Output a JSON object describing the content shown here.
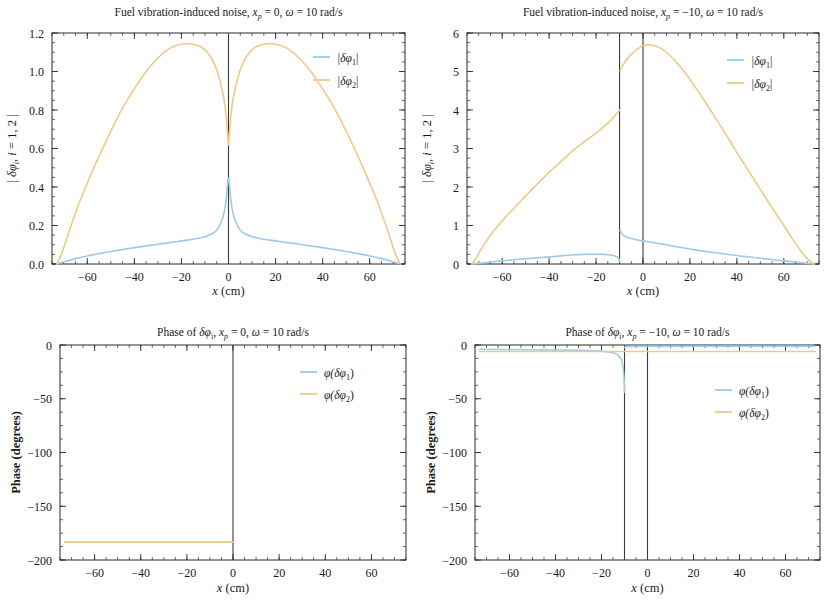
{
  "figure": {
    "background_color": "#ffffff",
    "series_colors": {
      "phi1": "#9fcbe8",
      "phi2": "#f0c98a"
    },
    "axis_color": "#2b2b2b"
  },
  "panels": [
    {
      "id": "top-left",
      "title": "Fuel vibration-induced noise, x_p = 0, ω = 10 rad/s",
      "title_parts": {
        "prefix": "Fuel vibration-induced noise, ",
        "var": "x",
        "sub": "p",
        "mid": " = 0, ",
        "omega": "ω",
        "suffix": " = 10 rad/s"
      },
      "xlabel": "x (cm)",
      "ylabel": "| δφ_i, i = 1, 2 |",
      "xticks": [
        -60,
        -40,
        -20,
        0,
        20,
        40,
        60
      ],
      "yticks": [
        "0.0",
        "0.2",
        "0.4",
        "0.6",
        "0.8",
        "1.0",
        "1.2"
      ],
      "xlim": [
        -75,
        75
      ],
      "ylim": [
        0.0,
        1.2
      ],
      "vertical_marker": 0,
      "legend": [
        {
          "label": "|δφ₁|",
          "base": "|δφ",
          "sub": "1",
          "close": "|",
          "color": "#9fcbe8"
        },
        {
          "label": "|δφ₂|",
          "base": "|δφ",
          "sub": "2",
          "close": "|",
          "color": "#f0c98a"
        }
      ]
    },
    {
      "id": "top-right",
      "title": "Fuel vibration-induced noise, x_p = -10, ω = 10 rad/s",
      "title_parts": {
        "prefix": "Fuel vibration-induced noise, ",
        "var": "x",
        "sub": "p",
        "mid": " = −10, ",
        "omega": "ω",
        "suffix": " = 10 rad/s"
      },
      "xlabel": "x (cm)",
      "ylabel": "| δφ_i, i = 1, 2 |",
      "xticks": [
        -60,
        -40,
        -20,
        0,
        20,
        40,
        60
      ],
      "yticks": [
        "0",
        "1",
        "2",
        "3",
        "4",
        "5",
        "6"
      ],
      "xlim": [
        -75,
        75
      ],
      "ylim": [
        0,
        6
      ],
      "vertical_marker": 0,
      "vertical_marker_2": -10,
      "legend": [
        {
          "label": "|δφ₁|",
          "base": "|δφ",
          "sub": "1",
          "close": "|",
          "color": "#9fcbe8"
        },
        {
          "label": "|δφ₂|",
          "base": "|δφ",
          "sub": "2",
          "close": "|",
          "color": "#f0c98a"
        }
      ]
    },
    {
      "id": "bottom-left",
      "title": "Phase of δφ_i, x_p = 0, ω = 10 rad/s",
      "title_parts": {
        "prefix": "Phase of ",
        "delta": "δφ",
        "isub": "i",
        "comma": ", ",
        "var": "x",
        "sub": "p",
        "mid": " = 0, ",
        "omega": "ω",
        "suffix": " = 10 rad/s"
      },
      "xlabel": "x (cm)",
      "ylabel": "Phase (degrees)",
      "xticks": [
        -60,
        -40,
        -20,
        0,
        20,
        40,
        60
      ],
      "yticks": [
        "0",
        "−50",
        "−100",
        "−150",
        "−200"
      ],
      "xlim": [
        -75,
        75
      ],
      "ylim": [
        -200,
        0
      ],
      "vertical_marker": 0,
      "legend": [
        {
          "label": "φ(δφ₁)",
          "base": "φ(δφ",
          "sub": "1",
          "close": ")",
          "color": "#9fcbe8"
        },
        {
          "label": "φ(δφ₂)",
          "base": "φ(δφ",
          "sub": "2",
          "close": ")",
          "color": "#f0c98a"
        }
      ]
    },
    {
      "id": "bottom-right",
      "title": "Phase of δφ_i, x_p = -10, ω = 10 rad/s",
      "title_parts": {
        "prefix": "Phase of ",
        "delta": "δφ",
        "isub": "i",
        "comma": ", ",
        "var": "x",
        "sub": "p",
        "mid": " = −10, ",
        "omega": "ω",
        "suffix": " = 10 rad/s"
      },
      "xlabel": "x (cm)",
      "ylabel": "Phase (degrees)",
      "xticks": [
        -60,
        -40,
        -20,
        0,
        20,
        40,
        60
      ],
      "yticks": [
        "0",
        "−50",
        "−100",
        "−150",
        "−200"
      ],
      "xlim": [
        -75,
        75
      ],
      "ylim": [
        -200,
        0
      ],
      "vertical_marker": 0,
      "vertical_marker_2": -10,
      "legend": [
        {
          "label": "φ(δφ₁)",
          "base": "φ(δφ",
          "sub": "1",
          "close": ")",
          "color": "#9fcbe8"
        },
        {
          "label": "φ(δφ₂)",
          "base": "φ(δφ",
          "sub": "2",
          "close": ")",
          "color": "#f0c98a"
        }
      ]
    }
  ],
  "chart_data": [
    {
      "type": "line",
      "panel": "top-left",
      "title": "Fuel vibration-induced noise, x_p = 0, ω = 10 rad/s",
      "xlabel": "x (cm)",
      "ylabel": "| δφ_i, i = 1, 2 |",
      "xlim": [
        -75,
        75
      ],
      "ylim": [
        0.0,
        1.2
      ],
      "xticks": [
        -60,
        -40,
        -20,
        0,
        20,
        40,
        60
      ],
      "yticks": [
        0.0,
        0.2,
        0.4,
        0.6,
        0.8,
        1.0,
        1.2
      ],
      "grid": false,
      "legend_position": "top-right",
      "annotations": [
        {
          "type": "vline",
          "x": 0
        }
      ],
      "series": [
        {
          "name": "|δφ₁|",
          "color": "#9fcbe8",
          "x": [
            -73,
            -70,
            -65,
            -60,
            -55,
            -50,
            -45,
            -40,
            -35,
            -30,
            -25,
            -20,
            -15,
            -10,
            -7,
            -5,
            -3,
            -2,
            -1,
            -0.3,
            0,
            0.3,
            1,
            2,
            3,
            5,
            7,
            10,
            15,
            20,
            25,
            30,
            35,
            40,
            45,
            50,
            55,
            60,
            65,
            70,
            73
          ],
          "y": [
            0.0,
            0.012,
            0.028,
            0.042,
            0.054,
            0.065,
            0.075,
            0.085,
            0.094,
            0.103,
            0.111,
            0.12,
            0.129,
            0.142,
            0.157,
            0.175,
            0.22,
            0.26,
            0.33,
            0.43,
            0.445,
            0.43,
            0.33,
            0.26,
            0.22,
            0.175,
            0.157,
            0.142,
            0.129,
            0.12,
            0.111,
            0.103,
            0.094,
            0.085,
            0.075,
            0.065,
            0.054,
            0.042,
            0.028,
            0.012,
            0.0
          ]
        },
        {
          "name": "|δφ₂|",
          "color": "#f0c98a",
          "x": [
            -73,
            -71,
            -68,
            -64,
            -60,
            -55,
            -50,
            -45,
            -40,
            -35,
            -30,
            -25,
            -20,
            -17,
            -15,
            -12,
            -9,
            -6,
            -4,
            -2,
            -1,
            -0.3,
            0,
            0.3,
            1,
            2,
            4,
            6,
            9,
            12,
            15,
            17,
            20,
            25,
            30,
            35,
            40,
            45,
            50,
            55,
            60,
            64,
            68,
            71,
            73
          ],
          "y": [
            0.0,
            0.05,
            0.16,
            0.3,
            0.42,
            0.56,
            0.69,
            0.81,
            0.91,
            1.0,
            1.07,
            1.12,
            1.142,
            1.145,
            1.142,
            1.13,
            1.1,
            1.04,
            0.97,
            0.86,
            0.77,
            0.66,
            0.62,
            0.66,
            0.77,
            0.86,
            0.97,
            1.04,
            1.1,
            1.13,
            1.142,
            1.145,
            1.142,
            1.12,
            1.07,
            1.0,
            0.91,
            0.81,
            0.69,
            0.56,
            0.42,
            0.3,
            0.16,
            0.05,
            0.0
          ]
        }
      ]
    },
    {
      "type": "line",
      "panel": "top-right",
      "title": "Fuel vibration-induced noise, x_p = -10, ω = 10 rad/s",
      "xlabel": "x (cm)",
      "ylabel": "| δφ_i, i = 1, 2 |",
      "xlim": [
        -75,
        75
      ],
      "ylim": [
        0,
        6
      ],
      "xticks": [
        -60,
        -40,
        -20,
        0,
        20,
        40,
        60
      ],
      "yticks": [
        0,
        1,
        2,
        3,
        4,
        5,
        6
      ],
      "grid": false,
      "legend_position": "top-right",
      "annotations": [
        {
          "type": "vline",
          "x": 0
        },
        {
          "type": "vline",
          "x": -10
        }
      ],
      "series": [
        {
          "name": "|δφ₁|",
          "color": "#9fcbe8",
          "x": [
            -73,
            -70,
            -65,
            -60,
            -55,
            -50,
            -45,
            -40,
            -35,
            -30,
            -25,
            -22,
            -20,
            -17,
            -14,
            -12,
            -10.5,
            -10,
            -9.8,
            -9,
            -7,
            -5,
            -2,
            0,
            3,
            6,
            10,
            15,
            20,
            25,
            30,
            35,
            40,
            45,
            50,
            55,
            60,
            65,
            70,
            73
          ],
          "y": [
            0.0,
            0.02,
            0.05,
            0.08,
            0.11,
            0.135,
            0.16,
            0.185,
            0.21,
            0.235,
            0.25,
            0.255,
            0.255,
            0.25,
            0.235,
            0.21,
            0.16,
            0.06,
            0.88,
            0.78,
            0.7,
            0.66,
            0.62,
            0.6,
            0.57,
            0.54,
            0.5,
            0.44,
            0.39,
            0.34,
            0.3,
            0.26,
            0.22,
            0.185,
            0.15,
            0.115,
            0.082,
            0.05,
            0.018,
            0.0
          ]
        },
        {
          "name": "|δφ₂|",
          "color": "#f0c98a",
          "x": [
            -73,
            -71,
            -68,
            -64,
            -60,
            -55,
            -50,
            -45,
            -40,
            -35,
            -30,
            -25,
            -20,
            -16,
            -13,
            -11,
            -10.2,
            -10,
            -9.8,
            -8,
            -6,
            -4,
            -2,
            0,
            2,
            4,
            7,
            10,
            14,
            18,
            22,
            26,
            30,
            35,
            40,
            45,
            50,
            55,
            60,
            64,
            68,
            71,
            73
          ],
          "y": [
            0.0,
            0.17,
            0.48,
            0.83,
            1.12,
            1.45,
            1.77,
            2.08,
            2.38,
            2.66,
            2.94,
            3.18,
            3.4,
            3.6,
            3.78,
            3.92,
            3.98,
            4.0,
            5.02,
            5.22,
            5.38,
            5.5,
            5.6,
            5.67,
            5.69,
            5.68,
            5.62,
            5.5,
            5.26,
            4.96,
            4.62,
            4.26,
            3.88,
            3.4,
            2.9,
            2.42,
            1.94,
            1.46,
            1.0,
            0.62,
            0.28,
            0.08,
            0.0
          ]
        }
      ]
    },
    {
      "type": "line",
      "panel": "bottom-left",
      "title": "Phase of δφ_i, x_p = 0, ω = 10 rad/s",
      "xlabel": "x (cm)",
      "ylabel": "Phase (degrees)",
      "xlim": [
        -75,
        75
      ],
      "ylim": [
        -200,
        0
      ],
      "xticks": [
        -60,
        -40,
        -20,
        0,
        20,
        40,
        60
      ],
      "yticks": [
        0,
        -50,
        -100,
        -150,
        -200
      ],
      "grid": false,
      "legend_position": "top-right",
      "annotations": [
        {
          "type": "vline",
          "x": 0
        }
      ],
      "series": [
        {
          "name": "φ(δφ₁)",
          "color": "#9fcbe8",
          "x": [
            -73,
            -40,
            -20,
            -5,
            0
          ],
          "y": [
            -183.5,
            -183.5,
            -183.5,
            -183.5,
            -183.5
          ]
        },
        {
          "name": "φ(δφ₂)",
          "color": "#f0c98a",
          "x": [
            -73,
            -60,
            -40,
            -20,
            -10,
            -2,
            0
          ],
          "y": [
            -183.5,
            -183.5,
            -183.5,
            -183.5,
            -183.5,
            -183.5,
            -183.5
          ]
        }
      ]
    },
    {
      "type": "line",
      "panel": "bottom-right",
      "title": "Phase of δφ_i, x_p = -10, ω = 10 rad/s",
      "xlabel": "x (cm)",
      "ylabel": "Phase (degrees)",
      "xlim": [
        -75,
        75
      ],
      "ylim": [
        -200,
        0
      ],
      "xticks": [
        -60,
        -40,
        -20,
        0,
        20,
        40,
        60
      ],
      "yticks": [
        0,
        -50,
        -100,
        -150,
        -200
      ],
      "grid": false,
      "legend_position": "right",
      "annotations": [
        {
          "type": "vline",
          "x": 0
        },
        {
          "type": "vline",
          "x": -10
        }
      ],
      "series": [
        {
          "name": "φ(δφ₁)",
          "color": "#9fcbe8",
          "x": [
            -73,
            -60,
            -45,
            -30,
            -22,
            -18,
            -16,
            -14,
            -13,
            -12,
            -11.2,
            -10.6,
            -10.2,
            -10.0,
            -9.9,
            -9.5,
            -8,
            -5,
            0,
            10,
            25,
            40,
            55,
            70,
            73
          ],
          "y": [
            -4.0,
            -4.2,
            -4.5,
            -5.0,
            -5.5,
            -6.2,
            -6.8,
            -8.0,
            -9.2,
            -11.5,
            -15.0,
            -21.0,
            -31.0,
            -44.0,
            -2.0,
            -1.6,
            -1.4,
            -1.3,
            -1.2,
            -1.2,
            -1.2,
            -1.2,
            -1.2,
            -1.2,
            -1.2
          ]
        },
        {
          "name": "φ(δφ₂)",
          "color": "#f0c98a",
          "x": [
            -73,
            -60,
            -45,
            -30,
            -20,
            -12,
            -10,
            -8,
            0,
            15,
            30,
            45,
            60,
            73
          ],
          "y": [
            -6.0,
            -6.0,
            -6.0,
            -6.0,
            -6.0,
            -6.0,
            -6.0,
            -6.0,
            -6.0,
            -6.0,
            -6.0,
            -6.0,
            -6.0,
            -6.0
          ]
        }
      ]
    }
  ]
}
